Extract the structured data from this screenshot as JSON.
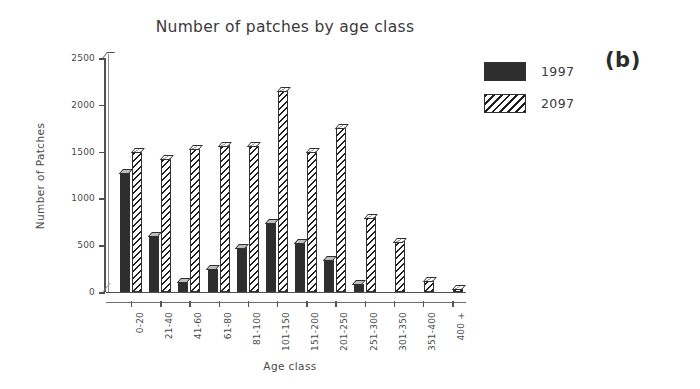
{
  "figure": {
    "panel_tag": "(b)",
    "title": "Number of patches by age class"
  },
  "chart_data": {
    "type": "bar",
    "title": "Number of patches by age class",
    "xlabel": "Age class",
    "ylabel": "Number of Patches",
    "ylim": [
      0,
      2500
    ],
    "yticks": [
      0,
      500,
      1000,
      1500,
      2000,
      2500
    ],
    "ytick_labels": [
      "0",
      "500",
      "1000",
      "1500",
      "2000",
      "2500"
    ],
    "grid": false,
    "legend_position": "top-right",
    "categories": [
      "0-20",
      "21-40",
      "41-60",
      "61-80",
      "81-100",
      "101-150",
      "151-200",
      "201-250",
      "251-300",
      "301-350",
      "351-400",
      "400 +"
    ],
    "series": [
      {
        "name": "1997",
        "color": "#2e2e2e",
        "fill": "solid",
        "values": [
          1280,
          600,
          110,
          250,
          480,
          740,
          530,
          350,
          90,
          0,
          0,
          0
        ]
      },
      {
        "name": "2097",
        "color": "#1f1f1f",
        "fill": "diagonal-hatch",
        "values": [
          1500,
          1430,
          1530,
          1570,
          1560,
          2150,
          1500,
          1760,
          800,
          540,
          120,
          40
        ]
      }
    ]
  }
}
